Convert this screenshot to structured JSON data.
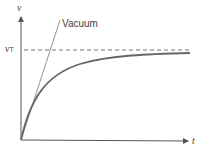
{
  "diagram": {
    "y_axis_label": "v",
    "x_axis_label": "t",
    "terminal_label": "v",
    "terminal_subscript": "T",
    "vacuum_label": "Vacuum",
    "colors": {
      "axis": "#555555",
      "curve": "#666666",
      "dashed": "#777777",
      "vacuum": "#777777"
    }
  }
}
